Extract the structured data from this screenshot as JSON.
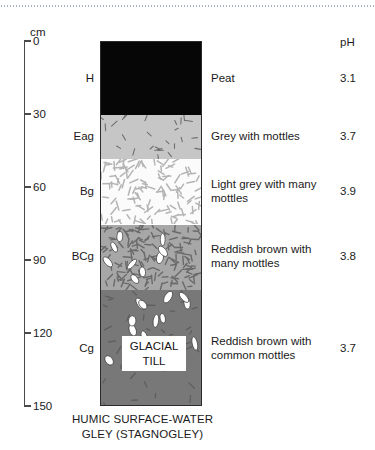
{
  "figure": {
    "caption_line1": "HUMIC SURFACE-WATER",
    "caption_line2": "GLEY (STAGNOGLEY)",
    "till_label_line1": "GLACIAL",
    "till_label_line2": "TILL"
  },
  "axis": {
    "unit": "cm",
    "ticks": [
      {
        "label": "0",
        "depth_cm": 0
      },
      {
        "label": "30",
        "depth_cm": 30
      },
      {
        "label": "60",
        "depth_cm": 60
      },
      {
        "label": "90",
        "depth_cm": 90
      },
      {
        "label": "120",
        "depth_cm": 120
      },
      {
        "label": "150",
        "depth_cm": 150
      }
    ]
  },
  "ph_column_header": "pH",
  "chart_data": {
    "type": "table",
    "title": "HUMIC SURFACE-WATER GLEY (STAGNOGLEY)",
    "ylabel": "cm",
    "ylim": [
      0,
      150
    ],
    "columns": [
      "Horizon",
      "Depth top (cm)",
      "Depth base (cm)",
      "Description",
      "pH"
    ],
    "horizons": [
      {
        "code": "H",
        "top_cm": 0,
        "base_cm": 30,
        "description": "Peat",
        "ph": "3.1",
        "color": "#060606",
        "pattern": "none"
      },
      {
        "code": "Eag",
        "top_cm": 30,
        "base_cm": 48,
        "description": "Grey with mottles",
        "ph": "3.7",
        "color": "#c6c6c6",
        "pattern": "few-dark-flecks"
      },
      {
        "code": "Bg",
        "top_cm": 48,
        "base_cm": 75,
        "description": "Light grey with many mottles",
        "ph": "3.9",
        "color": "#fbfbfb",
        "pattern": "many-grey-flecks"
      },
      {
        "code": "BCg",
        "top_cm": 75,
        "base_cm": 102,
        "description": "Reddish brown with many mottles",
        "ph": "3.8",
        "color": "#a7a7a7",
        "pattern": "dark-flecks-white-mottles"
      },
      {
        "code": "Cg",
        "top_cm": 102,
        "base_cm": 150,
        "description": "Reddish brown with common mottles",
        "ph": "3.7",
        "color": "#787878",
        "pattern": "sparse-white-mottles"
      }
    ]
  }
}
